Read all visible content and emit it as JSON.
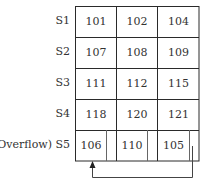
{
  "diagram": {
    "type": "hash-bucket-table-with-overflow",
    "columns": 3,
    "rows": [
      {
        "label": "S1",
        "values": [
          "101",
          "102",
          "104"
        ],
        "overflow": false
      },
      {
        "label": "S2",
        "values": [
          "107",
          "108",
          "109"
        ],
        "overflow": false
      },
      {
        "label": "S3",
        "values": [
          "111",
          "112",
          "115"
        ],
        "overflow": false
      },
      {
        "label": "S4",
        "values": [
          "118",
          "120",
          "121"
        ],
        "overflow": false
      },
      {
        "label": "(Overflow) S5",
        "values": [
          "106",
          "110",
          "105"
        ],
        "overflow": true
      }
    ],
    "pointer": {
      "from": "S5 cell 3 (105)",
      "to": "S5 cell 1 (106)",
      "description": "Pointer chain linking overflow entries"
    },
    "colors": {
      "line": "#2a2a2a",
      "pointer_line": "#555555",
      "text": "#333333",
      "background": "#ffffff"
    }
  }
}
